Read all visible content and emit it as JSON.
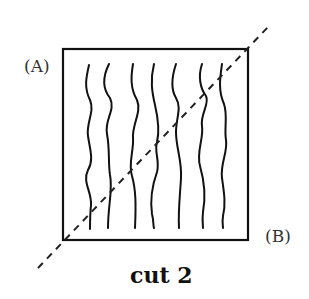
{
  "diagram": {
    "labels": {
      "a": "(A)",
      "b": "(B)",
      "caption": "cut 2"
    },
    "box": {
      "x": 63,
      "y": 49,
      "width": 185,
      "height": 191,
      "stroke": "#111111"
    },
    "cut_line": {
      "x1": 38,
      "y1": 268,
      "x2": 268,
      "y2": 27,
      "style": "dashed",
      "stroke": "#222222"
    },
    "fiber_count": 7,
    "fiber_x_positions": [
      88,
      107,
      133,
      153,
      175,
      202,
      221
    ]
  }
}
